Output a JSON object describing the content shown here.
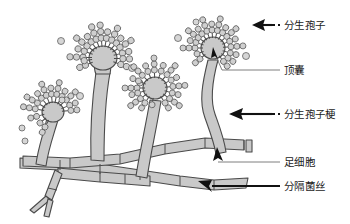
{
  "figure": {
    "background_color": "#ffffff",
    "structure_fill_color": "#c9c9c9",
    "structure_stroke_color": "#4a4a4a",
    "label_color": "#1a1a1a"
  },
  "labels": [
    {
      "id": "conidia",
      "text": "分生孢子",
      "x": 284,
      "y": 28,
      "leader": "thick-arrow-with-dash",
      "arrow_points_to": "conidial-chains"
    },
    {
      "id": "vesicle",
      "text": "顶囊",
      "x": 284,
      "y": 73,
      "leader": "thin-line-with-small-arrow",
      "arrow_points_to": "vesicle-swelling"
    },
    {
      "id": "conidiophore",
      "text": "分生孢子梗",
      "x": 284,
      "y": 117,
      "leader": "thick-arrow-with-dash",
      "arrow_points_to": "conidiophore-stalk"
    },
    {
      "id": "foot-cell",
      "text": "足细胞",
      "x": 284,
      "y": 165,
      "leader": "thin-line-with-up-arrow",
      "arrow_points_to": "foot-cell-junction"
    },
    {
      "id": "septate-hypha",
      "text": "分隔菌丝",
      "x": 284,
      "y": 191,
      "leader": "thick-arrow",
      "arrow_points_to": "septate-hypha-wall"
    }
  ],
  "conidiophores": [
    {
      "id": "head-1",
      "position": "far-left",
      "vesicle_cx": 53,
      "vesicle_cy": 112,
      "vesicle_r": 11,
      "chain_count": 13,
      "height": "short",
      "tilt": "left"
    },
    {
      "id": "head-2",
      "position": "left-center",
      "vesicle_cx": 103,
      "vesicle_cy": 60,
      "vesicle_r": 14,
      "chain_count": 15,
      "height": "tall",
      "tilt": "upright"
    },
    {
      "id": "head-3",
      "position": "right-center",
      "vesicle_cx": 155,
      "vesicle_cy": 88,
      "vesicle_r": 12,
      "chain_count": 16,
      "height": "medium",
      "tilt": "upright"
    },
    {
      "id": "head-4",
      "position": "far-right",
      "vesicle_cx": 213,
      "vesicle_cy": 48,
      "vesicle_r": 12,
      "chain_count": 16,
      "height": "tall",
      "tilt": "upright"
    }
  ],
  "hyphae": {
    "description": "branching septate hyphae network at base",
    "septa_count": 14
  }
}
